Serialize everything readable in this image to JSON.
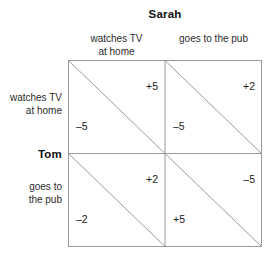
{
  "figure": {
    "type": "payoff-matrix",
    "column_player": "Sarah",
    "row_player": "Tom",
    "column_strategies": [
      "watches TV\nat home",
      "goes to the pub"
    ],
    "row_strategies": [
      "watches TV\nat home",
      "goes to\nthe pub"
    ],
    "cells": [
      [
        {
          "column_payoff": "+5",
          "row_payoff": "–5"
        },
        {
          "column_payoff": "+2",
          "row_payoff": "–5"
        }
      ],
      [
        {
          "column_payoff": "+2",
          "row_payoff": "–2"
        },
        {
          "column_payoff": "–5",
          "row_payoff": "+5"
        }
      ]
    ],
    "colors": {
      "line": "#9a9a9a",
      "text": "#1a1a1a",
      "background": "#ffffff"
    }
  },
  "chart_data": {
    "type": "table",
    "title": "Sarah",
    "xlabel": "Sarah",
    "ylabel": "Tom",
    "categories": [
      "watches TV at home",
      "goes to the pub"
    ],
    "series": [
      {
        "name": "Tom: watches TV at home",
        "values": [
          {
            "sarah": 5,
            "tom": -5
          },
          {
            "sarah": 2,
            "tom": -5
          }
        ]
      },
      {
        "name": "Tom: goes to the pub",
        "values": [
          {
            "sarah": 2,
            "tom": -2
          },
          {
            "sarah": -5,
            "tom": 5
          }
        ]
      }
    ]
  }
}
